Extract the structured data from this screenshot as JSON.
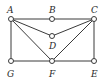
{
  "diagram": {
    "type": "graph",
    "nodes": [
      {
        "id": "A",
        "label": "A",
        "x": 11,
        "y": 19,
        "lx": 7,
        "ly": 13
      },
      {
        "id": "B",
        "label": "B",
        "x": 52,
        "y": 19,
        "lx": 49,
        "ly": 13
      },
      {
        "id": "C",
        "label": "C",
        "x": 94,
        "y": 19,
        "lx": 91,
        "ly": 13
      },
      {
        "id": "D",
        "label": "D",
        "x": 52,
        "y": 36,
        "lx": 49,
        "ly": 49
      },
      {
        "id": "G",
        "label": "G",
        "x": 11,
        "y": 61,
        "lx": 7,
        "ly": 77
      },
      {
        "id": "F",
        "label": "F",
        "x": 52,
        "y": 61,
        "lx": 49,
        "ly": 77
      },
      {
        "id": "E",
        "label": "E",
        "x": 94,
        "y": 61,
        "lx": 91,
        "ly": 77
      }
    ],
    "edges": [
      [
        "A",
        "B"
      ],
      [
        "B",
        "C"
      ],
      [
        "A",
        "D"
      ],
      [
        "D",
        "C"
      ],
      [
        "A",
        "F"
      ],
      [
        "C",
        "F"
      ],
      [
        "A",
        "G"
      ],
      [
        "G",
        "F"
      ],
      [
        "F",
        "E"
      ],
      [
        "C",
        "E"
      ]
    ]
  }
}
